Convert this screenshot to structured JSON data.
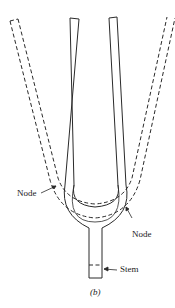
{
  "diagram": {
    "labels": {
      "node_left": "Node",
      "node_right": "Node",
      "stem": "Stem"
    },
    "caption": "(b)",
    "legend": {
      "solid": "rest position",
      "dashed": "displaced position"
    },
    "colors": {
      "line": "#2a2a2a",
      "background": "#ffffff"
    }
  }
}
